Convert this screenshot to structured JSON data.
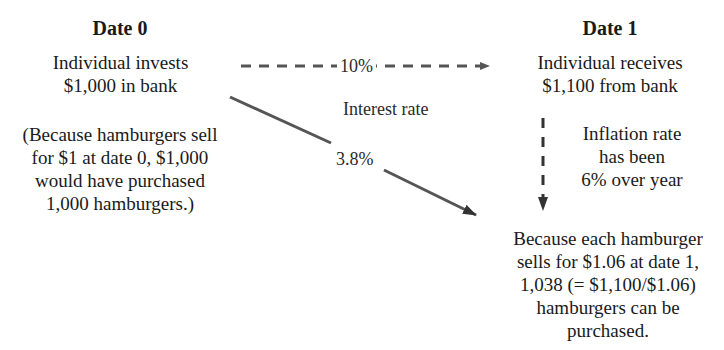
{
  "date0": {
    "heading": "Date 0",
    "lines": [
      "Individual invests",
      "$1,000 in bank"
    ],
    "note": [
      "(Because hamburgers sell",
      "for $1 at date 0, $1,000",
      "would have purchased",
      "1,000 hamburgers.)"
    ]
  },
  "date1": {
    "heading": "Date 1",
    "lines": [
      "Individual receives",
      "$1,100 from bank"
    ],
    "inflation": [
      "Inflation rate",
      "has been",
      "6% over year"
    ],
    "result": [
      "Because each hamburger",
      "sells for $1.06 at date 1,",
      "1,038 (= $1,100/$1.06)",
      "hamburgers can be",
      "purchased."
    ]
  },
  "arrows": {
    "nominal_rate": "10%",
    "interest_label": "Interest rate",
    "real_rate": "3.8%"
  },
  "colors": {
    "arrow": "#555555",
    "text": "#1a1a1a"
  }
}
